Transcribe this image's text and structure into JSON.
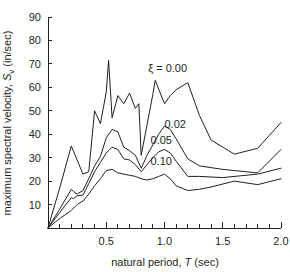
{
  "figure": {
    "background": "#ffffff",
    "ink_color": "#231f20",
    "width": 290,
    "height": 272
  },
  "chart_data": {
    "type": "line",
    "title": "",
    "xlabel_parts": {
      "pre": "natural period, ",
      "symbol": "T",
      "post": " (sec)"
    },
    "ylabel_parts": {
      "pre": "maximum spectral velocity, ",
      "symbol": "S",
      "subscript": "v",
      "post": " (in/sec)"
    },
    "xlabel": "natural period, T (sec)",
    "ylabel": "maximum spectral velocity, Sv (in/sec)",
    "xlim": [
      0,
      2.0
    ],
    "ylim": [
      0,
      90
    ],
    "grid": false,
    "legend_position": "inline-annotations",
    "x_major_ticks": [
      0.5,
      1.0,
      1.5,
      2.0
    ],
    "x_major_tick_labels": [
      "0.5",
      "1.0",
      "1.5",
      "2.0"
    ],
    "x_minor_tick_step": 0.1,
    "y_major_ticks": [
      10,
      20,
      30,
      40,
      50,
      60,
      70,
      80,
      90
    ],
    "y_major_tick_labels": [
      "10",
      "20",
      "30",
      "40",
      "50",
      "60",
      "70",
      "80",
      "90"
    ],
    "series": [
      {
        "name": "xi = 0.00",
        "label_symbol": "ξ",
        "label_text": "ξ = 0.00",
        "damping": "0.00",
        "label_x": 0.86,
        "label_y": 66.5,
        "x": [
          0.0,
          0.1,
          0.2,
          0.3,
          0.35,
          0.4,
          0.45,
          0.5,
          0.52,
          0.55,
          0.6,
          0.65,
          0.7,
          0.75,
          0.78,
          0.8,
          0.85,
          0.9,
          0.92,
          1.0,
          1.05,
          1.1,
          1.2,
          1.3,
          1.4,
          1.5,
          1.6,
          1.8,
          2.0
        ],
        "y": [
          0.0,
          17.0,
          35.0,
          23.0,
          24.0,
          50.0,
          44.5,
          58.0,
          71.5,
          47.0,
          56.5,
          53.0,
          57.5,
          51.0,
          53.0,
          31.0,
          44.0,
          57.0,
          63.0,
          53.0,
          56.5,
          59.0,
          62.0,
          48.0,
          37.5,
          34.5,
          31.5,
          34.0,
          45.0
        ]
      },
      {
        "name": "xi = 0.02",
        "label_text": "0.02",
        "damping": "0.02",
        "label_x": 1.0,
        "label_y": 42.5,
        "x": [
          0.0,
          0.1,
          0.2,
          0.22,
          0.25,
          0.3,
          0.35,
          0.4,
          0.45,
          0.5,
          0.55,
          0.6,
          0.65,
          0.7,
          0.75,
          0.8,
          0.85,
          0.9,
          0.95,
          1.0,
          1.05,
          1.1,
          1.2,
          1.3,
          1.5,
          1.8,
          2.0
        ],
        "y": [
          0.0,
          8.0,
          16.5,
          15.5,
          14.5,
          16.0,
          21.0,
          26.5,
          30.5,
          38.5,
          42.0,
          41.0,
          34.5,
          33.0,
          31.0,
          25.5,
          31.0,
          35.5,
          40.0,
          43.5,
          42.0,
          38.0,
          29.5,
          26.5,
          25.0,
          23.5,
          33.5
        ]
      },
      {
        "name": "xi = 0.05",
        "label_text": "0.05",
        "damping": "0.05",
        "label_x": 0.88,
        "label_y": 36.0,
        "x": [
          0.0,
          0.1,
          0.2,
          0.22,
          0.25,
          0.3,
          0.35,
          0.4,
          0.45,
          0.5,
          0.55,
          0.6,
          0.65,
          0.7,
          0.75,
          0.8,
          0.85,
          0.9,
          0.95,
          1.0,
          1.05,
          1.1,
          1.2,
          1.3,
          1.5,
          1.8,
          2.0
        ],
        "y": [
          0.0,
          6.5,
          13.0,
          12.5,
          13.8,
          14.0,
          19.0,
          24.0,
          28.0,
          32.0,
          34.5,
          33.5,
          29.5,
          29.0,
          27.0,
          24.0,
          27.0,
          30.0,
          32.5,
          33.5,
          32.0,
          28.5,
          22.0,
          22.0,
          21.5,
          23.0,
          25.5
        ]
      },
      {
        "name": "xi = 0.10",
        "label_text": "0.10",
        "damping": "0.10",
        "label_x": 0.88,
        "label_y": 27.0,
        "x": [
          0.0,
          0.1,
          0.2,
          0.25,
          0.3,
          0.35,
          0.4,
          0.45,
          0.5,
          0.55,
          0.6,
          0.65,
          0.7,
          0.75,
          0.8,
          0.85,
          0.9,
          0.95,
          1.0,
          1.05,
          1.1,
          1.2,
          1.3,
          1.4,
          1.6,
          1.8,
          2.0
        ],
        "y": [
          0.0,
          4.0,
          7.5,
          10.0,
          11.5,
          14.5,
          18.0,
          21.0,
          24.5,
          25.0,
          23.5,
          23.0,
          22.5,
          22.0,
          21.0,
          20.5,
          21.0,
          22.0,
          23.0,
          21.0,
          18.0,
          16.0,
          16.5,
          17.5,
          20.0,
          18.5,
          21.0
        ]
      }
    ]
  }
}
